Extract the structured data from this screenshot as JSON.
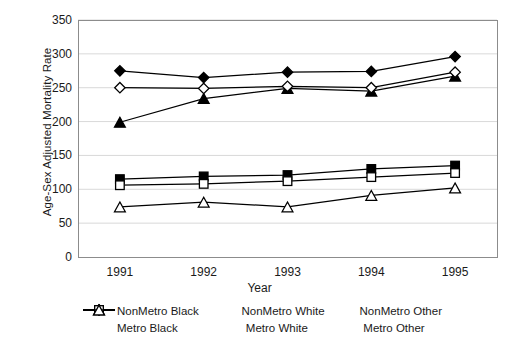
{
  "chart_data": {
    "type": "line",
    "title": "",
    "xlabel": "Year",
    "ylabel": "Age-Sex Adjusted Mortality Rate",
    "categories": [
      "1991",
      "1992",
      "1993",
      "1994",
      "1995"
    ],
    "xtick_labels": [
      "1991",
      "1992",
      "1993",
      "1994",
      "1995"
    ],
    "ytick_labels": [
      "350",
      "300",
      "250",
      "200",
      "150",
      "100",
      "50",
      "0"
    ],
    "yticks": [
      350,
      300,
      250,
      200,
      150,
      100,
      50,
      0
    ],
    "ylim": [
      0,
      350
    ],
    "grid": "horizontal",
    "legend_position": "bottom",
    "series": [
      {
        "name": "NonMetro Black",
        "marker": "diamond-filled",
        "color": "#000000",
        "values": [
          275,
          265,
          273,
          274,
          296
        ]
      },
      {
        "name": "NonMetro White",
        "marker": "square-filled",
        "color": "#000000",
        "values": [
          115,
          119,
          121,
          130,
          135
        ]
      },
      {
        "name": "NonMetro Other",
        "marker": "triangle-filled",
        "color": "#000000",
        "values": [
          199,
          234,
          249,
          245,
          267
        ]
      },
      {
        "name": "Metro Black",
        "marker": "diamond-open",
        "color": "#000000",
        "values": [
          250,
          249,
          252,
          250,
          273
        ]
      },
      {
        "name": "Metro White",
        "marker": "square-open",
        "color": "#000000",
        "values": [
          106,
          108,
          112,
          118,
          124
        ]
      },
      {
        "name": "Metro Other",
        "marker": "triangle-open",
        "color": "#000000",
        "values": [
          74,
          81,
          74,
          91,
          102
        ]
      }
    ]
  },
  "legend": {
    "rows": [
      [
        {
          "label": "NonMetro Black",
          "marker": "diamond-filled"
        },
        {
          "label": "NonMetro White",
          "marker": "square-filled"
        },
        {
          "label": "NonMetro Other",
          "marker": "triangle-filled"
        }
      ],
      [
        {
          "label": "Metro Black",
          "marker": "diamond-open"
        },
        {
          "label": "Metro White",
          "marker": "square-open"
        },
        {
          "label": "Metro Other",
          "marker": "triangle-open"
        }
      ]
    ]
  },
  "style": {
    "plot_border_color": "#8c8c8c",
    "gridline_color": "#d9d9d9",
    "line_color": "#000000",
    "background": "#ffffff"
  }
}
